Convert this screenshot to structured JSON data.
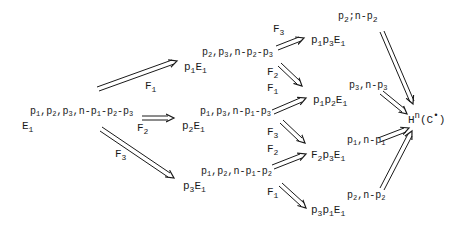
{
  "diagram": {
    "type": "spectral-sequence-filtration-diagram",
    "nodes": [
      {
        "id": "start",
        "base": "E_1",
        "superscript": "p_1,p_2,p_3,n-p_1-p_2-p_3"
      },
      {
        "id": "f1",
        "base": "p_1E_1",
        "superscript": "p_2,p_3,n-p_2-p_3"
      },
      {
        "id": "f2",
        "base": "p_2E_1",
        "superscript": "p_1,p_3,n-p_1-p_3"
      },
      {
        "id": "f3",
        "base": "p_3E_1",
        "superscript": "p_1,p_2,n-p_1-p_2"
      },
      {
        "id": "f13",
        "base": "p_1p_3E_1",
        "superscript": "p_2,n-p_2"
      },
      {
        "id": "f12",
        "base": "p_1p_2E_1",
        "superscript": "p_3,n-p_3"
      },
      {
        "id": "f23",
        "base": "p_2p_3E_1",
        "superscript": "p_1,n-p_1"
      },
      {
        "id": "f31",
        "base": "p_3p_1E_1",
        "superscript": "p_2,n-p_2"
      },
      {
        "id": "target",
        "base": "H^n(C•)"
      }
    ],
    "edges": [
      {
        "from": "start",
        "to": "f1",
        "label": "F_1"
      },
      {
        "from": "start",
        "to": "f2",
        "label": "F_2"
      },
      {
        "from": "start",
        "to": "f3",
        "label": "F_3"
      },
      {
        "from": "f1",
        "to": "f13",
        "label": "F_3"
      },
      {
        "from": "f1",
        "to": "f12",
        "label": "F_2"
      },
      {
        "from": "f2",
        "to": "f12",
        "label": "F_1"
      },
      {
        "from": "f2",
        "to": "f23",
        "label": "F_3"
      },
      {
        "from": "f3",
        "to": "f23",
        "label": "F_2"
      },
      {
        "from": "f3",
        "to": "f31",
        "label": "F_1"
      },
      {
        "from": "f13",
        "to": "target"
      },
      {
        "from": "f12",
        "to": "target"
      },
      {
        "from": "f23",
        "to": "target"
      },
      {
        "from": "f31",
        "to": "target"
      }
    ],
    "colors": {
      "ink": "#1a1a1a",
      "background": "#ffffff"
    }
  }
}
